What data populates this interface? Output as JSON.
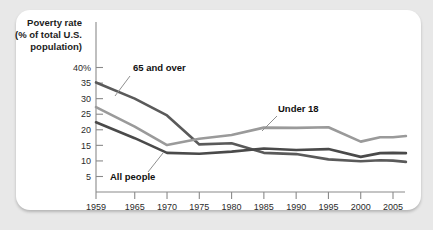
{
  "figure": {
    "background_color": "#e8e8e8",
    "card_color": "#ffffff"
  },
  "chart_data": {
    "type": "line",
    "title": "",
    "axis_title_lines": [
      "Poverty rate",
      "(% of total U.S.",
      "population)"
    ],
    "xlabel": "",
    "ylabel": "Poverty rate (% of total U.S. population)",
    "xlim": [
      1959,
      2008
    ],
    "ylim": [
      0,
      42
    ],
    "grid": false,
    "legend": "inline-annotations",
    "ytick_labels": [
      "40%",
      "35",
      "30",
      "25",
      "20",
      "15",
      "10",
      "5"
    ],
    "ytick_values": [
      40,
      35,
      30,
      25,
      20,
      15,
      10,
      5
    ],
    "xtick_labels": [
      "1959",
      "1965",
      "1970",
      "1975",
      "1980",
      "1985",
      "1990",
      "1995",
      "2000",
      "2005"
    ],
    "xtick_values": [
      1959,
      1965,
      1970,
      1975,
      1980,
      1985,
      1990,
      1995,
      2000,
      2005
    ],
    "series": [
      {
        "name": "65 and over",
        "color": "#5a5a5a",
        "x": [
          1959,
          1965,
          1970,
          1975,
          1980,
          1985,
          1990,
          1995,
          2000,
          2003,
          2005,
          2007
        ],
        "values": [
          35.2,
          30.0,
          24.6,
          15.3,
          15.7,
          12.6,
          12.2,
          10.5,
          9.9,
          10.2,
          10.1,
          9.7
        ]
      },
      {
        "name": "Under 18",
        "color": "#9a9a9a",
        "x": [
          1959,
          1965,
          1970,
          1975,
          1980,
          1985,
          1990,
          1995,
          2000,
          2003,
          2005,
          2007
        ],
        "values": [
          27.3,
          21.0,
          15.1,
          17.1,
          18.3,
          20.7,
          20.6,
          20.8,
          16.2,
          17.6,
          17.6,
          18.0
        ]
      },
      {
        "name": "All people",
        "color": "#4a4a4a",
        "x": [
          1959,
          1965,
          1970,
          1975,
          1980,
          1985,
          1990,
          1995,
          2000,
          2003,
          2005,
          2007
        ],
        "values": [
          22.4,
          17.3,
          12.6,
          12.3,
          13.0,
          14.0,
          13.5,
          13.8,
          11.3,
          12.5,
          12.6,
          12.5
        ]
      }
    ],
    "annotations": [
      {
        "name": "65 and over",
        "label": "65 and over",
        "label_x": 133,
        "label_y": 71,
        "leader": [
          [
            130,
            76
          ],
          [
            115,
            96
          ]
        ]
      },
      {
        "name": "Under 18",
        "label": "Under 18",
        "label_x": 278,
        "label_y": 112,
        "leader": [
          [
            277,
            116
          ],
          [
            262,
            131
          ]
        ]
      },
      {
        "name": "All people",
        "label": "All people",
        "label_x": 110,
        "label_y": 180,
        "leader": [
          [
            163,
            153
          ],
          [
            148,
            172
          ]
        ]
      }
    ]
  }
}
